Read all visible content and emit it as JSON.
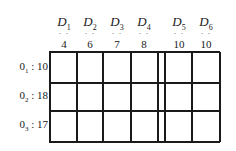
{
  "diagram": {
    "type": "transportation-table",
    "destinations": [
      {
        "name": "D",
        "sub": "1",
        "dots": "· ·",
        "demand": "4"
      },
      {
        "name": "D",
        "sub": "2",
        "dots": "· ·",
        "demand": "6"
      },
      {
        "name": "D",
        "sub": "3",
        "dots": "· ·",
        "demand": "7"
      },
      {
        "name": "D",
        "sub": "4",
        "dots": "· ·",
        "demand": "8"
      },
      {
        "name": "D",
        "sub": "5",
        "dots": "· ·",
        "demand": "10"
      },
      {
        "name": "D",
        "sub": "6",
        "dots": "· ·",
        "demand": "10"
      }
    ],
    "origins": [
      {
        "name": "0",
        "sub": "1",
        "sep": " : ",
        "supply": "10"
      },
      {
        "name": "0",
        "sub": "2",
        "sep": " : ",
        "supply": "18"
      },
      {
        "name": "0",
        "sub": "3",
        "sep": " : ",
        "supply": "17"
      }
    ],
    "line_color": "#1a1a1a"
  }
}
